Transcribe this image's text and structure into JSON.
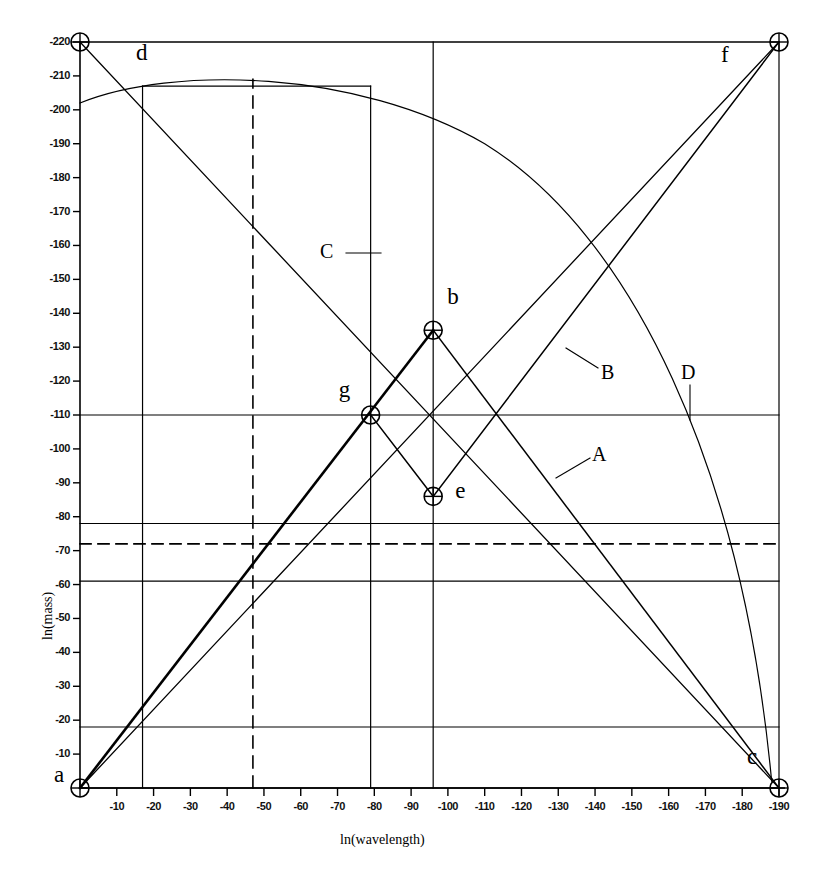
{
  "chart_data": {
    "type": "line",
    "title": "",
    "xlabel": "ln(wavelength)",
    "ylabel": "ln(mass)",
    "xlim": [
      0,
      -195
    ],
    "ylim": [
      0,
      -225
    ],
    "grid": false,
    "legend": "none",
    "x_ticks": [
      "-10",
      "-20",
      "-30",
      "-40",
      "-50",
      "-60",
      "-70",
      "-80",
      "-90",
      "-100",
      "-110",
      "-120",
      "-130",
      "-140",
      "-150",
      "-160",
      "-170",
      "-180",
      "-190"
    ],
    "y_ticks": [
      "-10",
      "-20",
      "-30",
      "-40",
      "-50",
      "-60",
      "-70",
      "-80",
      "-90",
      "-100",
      "-110",
      "-120",
      "-130",
      "-140",
      "-150",
      "-160",
      "-170",
      "-180",
      "-190",
      "-200",
      "-210",
      "-220"
    ],
    "points": [
      {
        "label": "a",
        "x": 0,
        "y": 0
      },
      {
        "label": "b",
        "x": -96,
        "y": -135
      },
      {
        "label": "c",
        "x": -190,
        "y": 0
      },
      {
        "label": "d",
        "x": 0,
        "y": -220
      },
      {
        "label": "e",
        "x": -96,
        "y": -86
      },
      {
        "label": "f",
        "x": -190,
        "y": -220
      },
      {
        "label": "g",
        "x": -79,
        "y": -110
      }
    ],
    "annotations": [
      {
        "label": "A",
        "x": -131,
        "y": -98
      },
      {
        "label": "B",
        "x": -134,
        "y": -123
      },
      {
        "label": "C",
        "x": -70,
        "y": -173
      },
      {
        "label": "D",
        "x": -152,
        "y": -123
      }
    ],
    "series": [
      {
        "name": "boundary-top",
        "comment": "a-d-f-c frame top edge",
        "x": [
          0,
          -190
        ],
        "values": [
          -220,
          -220
        ]
      },
      {
        "name": "boundary-bottom",
        "comment": "a to c baseline",
        "x": [
          0,
          -190
        ],
        "values": [
          0,
          0
        ]
      },
      {
        "name": "diagonal-a-f",
        "comment": "rising line a to f",
        "x": [
          0,
          -190
        ],
        "values": [
          0,
          -220
        ]
      },
      {
        "name": "diagonal-d-c",
        "comment": "falling line d to c",
        "x": [
          0,
          -190
        ],
        "values": [
          -220,
          0
        ]
      },
      {
        "name": "segment-g-b",
        "comment": "heavy segment g to b",
        "x": [
          -79,
          -96
        ],
        "values": [
          -110,
          -135
        ]
      },
      {
        "name": "segment-b-e",
        "comment": "segment b down to e",
        "x": [
          -96,
          -96
        ],
        "values": [
          -135,
          -86
        ]
      },
      {
        "name": "arc-quadrant",
        "comment": "large arc from left edge to point c",
        "x": [
          0,
          -50,
          -100,
          -150,
          -190
        ],
        "values": [
          -202,
          -211,
          -196,
          -140,
          -8
        ]
      }
    ],
    "horizontal_lines": [
      -18,
      -61,
      -72,
      -78,
      -110,
      -207
    ],
    "vertical_lines": [
      -17,
      -47,
      -79,
      -96
    ],
    "dashed_horizontal": [
      -72
    ],
    "dashed_vertical": [
      -47
    ]
  },
  "axis": {
    "x_title": "ln(wavelength)",
    "y_title": "ln(mass)"
  },
  "labels": {
    "a": "a",
    "b": "b",
    "c": "c",
    "d": "d",
    "e": "e",
    "f": "f",
    "g": "g",
    "A": "A",
    "B": "B",
    "C": "C",
    "D": "D"
  }
}
